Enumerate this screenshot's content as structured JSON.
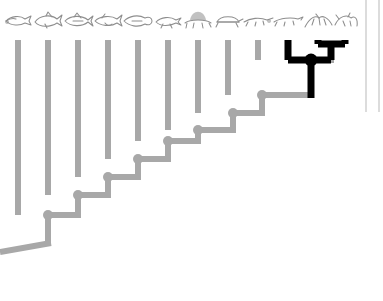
{
  "figure": {
    "type": "cladogram",
    "background_color": "#ffffff",
    "lineage_color": "#a8a8a8",
    "highlight_color": "#000000",
    "silhouette_color": "#8e8e8e",
    "rule_color": "#b9b9b9",
    "branch_thickness": 6,
    "highlight_thickness": 7,
    "node_radius": 5
  },
  "axis": {
    "orientation": "left-to-right-ascending",
    "tip_spacing_px": 30,
    "node_rise_px": 18,
    "root_x": 0,
    "root_y": 250
  },
  "chart_data": {
    "type": "tree",
    "tip_count": 14,
    "gray_tip_count": 11,
    "highlighted_tip_count": 3,
    "tips": [
      {
        "index": 0,
        "x": 18,
        "tip_y": 40,
        "silhouette": "jawless-fish",
        "highlight": false
      },
      {
        "index": 1,
        "x": 48,
        "tip_y": 40,
        "silhouette": "cartilaginous-fish",
        "highlight": false
      },
      {
        "index": 2,
        "x": 78,
        "tip_y": 40,
        "silhouette": "ray-finned-fish",
        "highlight": false
      },
      {
        "index": 3,
        "x": 108,
        "tip_y": 40,
        "silhouette": "lobe-finned-fish",
        "highlight": false
      },
      {
        "index": 4,
        "x": 138,
        "tip_y": 40,
        "silhouette": "lungfish",
        "highlight": false
      },
      {
        "index": 5,
        "x": 168,
        "tip_y": 40,
        "silhouette": "amphibian",
        "highlight": false
      },
      {
        "index": 6,
        "x": 198,
        "tip_y": 40,
        "silhouette": "sail-backed-synapsid",
        "highlight": false
      },
      {
        "index": 7,
        "x": 228,
        "tip_y": 40,
        "silhouette": "turtle",
        "highlight": false
      },
      {
        "index": 8,
        "x": 258,
        "tip_y": 40,
        "silhouette": "lizard",
        "highlight": false
      },
      {
        "index": 9,
        "x": 288,
        "tip_y": 40,
        "silhouette": "crocodilian",
        "highlight": true
      },
      {
        "index": 10,
        "x": 318,
        "tip_y": 40,
        "silhouette": "pterosaur",
        "highlight": true
      },
      {
        "index": 11,
        "x": 345,
        "tip_y": 40,
        "silhouette": "bird",
        "highlight": true
      }
    ],
    "nodes": [
      {
        "id": "n1",
        "x": 48,
        "y": 215,
        "highlight": false
      },
      {
        "id": "n2",
        "x": 78,
        "y": 195,
        "highlight": false
      },
      {
        "id": "n3",
        "x": 108,
        "y": 177,
        "highlight": false
      },
      {
        "id": "n4",
        "x": 138,
        "y": 159,
        "highlight": false
      },
      {
        "id": "n5",
        "x": 168,
        "y": 141,
        "highlight": false
      },
      {
        "id": "n6",
        "x": 198,
        "y": 130,
        "highlight": false
      },
      {
        "id": "n7",
        "x": 233,
        "y": 113,
        "highlight": false
      },
      {
        "id": "n8",
        "x": 262,
        "y": 95,
        "highlight": false
      },
      {
        "id": "n9",
        "x": 311,
        "y": 60,
        "highlight": true
      },
      {
        "id": "n10",
        "x": 331,
        "y": 44,
        "highlight": true
      }
    ],
    "root": {
      "from_x": 48,
      "from_y": 215,
      "elbow_y": 243,
      "to_x": 0,
      "to_y": 252
    },
    "rules": [
      {
        "name": "panel-rule-inner",
        "x": 366,
        "y0": 0,
        "y1": 112
      },
      {
        "name": "panel-rule-outer",
        "x": 379,
        "y0": 0,
        "y1": 112
      }
    ]
  },
  "labels": {
    "caption": ""
  }
}
